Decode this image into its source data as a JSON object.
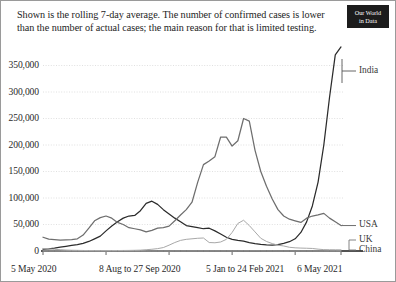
{
  "header": {
    "subtitle": "Shown is the rolling 7-day average. The number of confirmed cases is lower than the number of actual cases; the main reason for that is limited testing.",
    "logo_line1": "Our World",
    "logo_line2": "in Data"
  },
  "chart_data": {
    "type": "line",
    "title": "",
    "subtitle": "Shown is the rolling 7-day average. The number of confirmed cases is lower than the number of actual cases; the main reason for that is limited testing.",
    "xlabel": "",
    "ylabel": "",
    "ylim": [
      0,
      400000
    ],
    "yticks": [
      0,
      50000,
      100000,
      150000,
      200000,
      250000,
      300000,
      350000
    ],
    "ytick_labels": [
      "0",
      "50,000",
      "100,000",
      "150,000",
      "200,000",
      "250,000",
      "300,000",
      "350,000"
    ],
    "xtick_labels": [
      "5 May 2020",
      "8 Aug to 27 Sep 2020",
      "5 Jan to 24 Feb 2021",
      "6 May 2021"
    ],
    "x_start": "5 May 2020",
    "x_end": "6 May 2021",
    "grid": true,
    "legend_position": "right-inline",
    "legend": [
      "India",
      "USA",
      "UK",
      "China"
    ],
    "colors": {
      "India": "#2b2b2b",
      "USA": "#6e6e6e",
      "UK": "#a8a8a8",
      "China": "#b8b8b8",
      "grid": "#d8d8d8",
      "axis": "#1a1a1a"
    },
    "x": [
      0,
      1,
      2,
      3,
      4,
      5,
      6,
      7,
      8,
      9,
      10,
      11,
      12,
      13,
      14,
      15,
      16,
      17,
      18,
      19,
      20,
      21,
      22,
      23,
      24,
      25,
      26,
      27,
      28,
      29,
      30,
      31,
      32,
      33,
      34,
      35,
      36,
      37,
      38,
      39,
      40,
      41,
      42,
      43,
      44,
      45,
      46,
      47,
      48,
      49,
      50,
      51,
      52
    ],
    "x_week_labels": [
      "5 May 2020",
      "12 May 2020",
      "19 May 2020",
      "26 May 2020",
      "2 Jun 2020",
      "9 Jun 2020",
      "16 Jun 2020",
      "23 Jun 2020",
      "30 Jun 2020",
      "7 Jul 2020",
      "14 Jul 2020",
      "21 Jul 2020",
      "28 Jul 2020",
      "4 Aug 2020",
      "11 Aug 2020",
      "18 Aug 2020",
      "25 Aug 2020",
      "1 Sep 2020",
      "8 Sep 2020",
      "15 Sep 2020",
      "22 Sep 2020",
      "29 Sep 2020",
      "6 Oct 2020",
      "13 Oct 2020",
      "20 Oct 2020",
      "27 Oct 2020",
      "3 Nov 2020",
      "10 Nov 2020",
      "17 Nov 2020",
      "24 Nov 2020",
      "1 Dec 2020",
      "8 Dec 2020",
      "15 Dec 2020",
      "22 Dec 2020",
      "29 Dec 2020",
      "5 Jan 2021",
      "12 Jan 2021",
      "19 Jan 2021",
      "26 Jan 2021",
      "2 Feb 2021",
      "9 Feb 2021",
      "16 Feb 2021",
      "23 Feb 2021",
      "2 Mar 2021",
      "9 Mar 2021",
      "16 Mar 2021",
      "23 Mar 2021",
      "30 Mar 2021",
      "6 Apr 2021",
      "13 Apr 2021",
      "20 Apr 2021",
      "27 Apr 2021",
      "6 May 2021"
    ],
    "series": [
      {
        "name": "India",
        "color": "#2b2b2b",
        "values": [
          3500,
          4200,
          5500,
          7200,
          8800,
          10500,
          12000,
          14500,
          18000,
          23000,
          28000,
          38000,
          47000,
          55000,
          62000,
          66000,
          67000,
          76000,
          90000,
          94000,
          88000,
          78000,
          70000,
          62000,
          55000,
          48000,
          46000,
          44000,
          42000,
          43000,
          38000,
          32000,
          26000,
          22000,
          20000,
          18500,
          16000,
          14000,
          12500,
          11500,
          11000,
          12000,
          14500,
          17500,
          23000,
          35000,
          55000,
          85000,
          130000,
          200000,
          290000,
          370000,
          385000
        ]
      },
      {
        "name": "USA",
        "color": "#6e6e6e",
        "values": [
          26000,
          22500,
          21500,
          20500,
          21000,
          21500,
          23000,
          30000,
          43000,
          57000,
          63000,
          66000,
          62000,
          54000,
          50000,
          44000,
          42000,
          40000,
          36000,
          39000,
          43000,
          44000,
          47000,
          57000,
          68000,
          78000,
          92000,
          130000,
          163000,
          170000,
          178000,
          215000,
          215000,
          198000,
          208000,
          250000,
          245000,
          190000,
          150000,
          122000,
          98000,
          78000,
          66000,
          60000,
          57000,
          54000,
          62000,
          66000,
          68000,
          71000,
          62000,
          55000,
          48000
        ]
      },
      {
        "name": "UK",
        "color": "#a8a8a8",
        "values": [
          4800,
          3900,
          3200,
          2500,
          1800,
          1400,
          1200,
          1000,
          800,
          700,
          650,
          700,
          800,
          900,
          1000,
          1100,
          1300,
          1600,
          2400,
          3300,
          4500,
          6500,
          11000,
          16000,
          20000,
          22000,
          23000,
          24000,
          24500,
          16000,
          15500,
          17000,
          22000,
          35000,
          52000,
          58000,
          48000,
          36000,
          24000,
          18000,
          14000,
          11000,
          9500,
          7000,
          6000,
          5500,
          5200,
          4800,
          3500,
          2600,
          2400,
          2300,
          2200
        ]
      },
      {
        "name": "China",
        "color": "#b8b8b8",
        "values": [
          50,
          60,
          55,
          45,
          40,
          35,
          60,
          50,
          45,
          40,
          35,
          30,
          35,
          40,
          45,
          40,
          35,
          30,
          28,
          25,
          22,
          20,
          25,
          30,
          35,
          40,
          45,
          50,
          55,
          50,
          45,
          40,
          45,
          50,
          60,
          90,
          120,
          110,
          80,
          50,
          35,
          25,
          20,
          18,
          15,
          14,
          13,
          15,
          18,
          20,
          22,
          20,
          18
        ]
      }
    ],
    "annotations": [
      {
        "text": "India",
        "near_value": 385000
      },
      {
        "text": "USA",
        "near_value": 48000
      },
      {
        "text": "UK",
        "near_value": 2200
      },
      {
        "text": "China",
        "near_value": 18
      }
    ]
  }
}
